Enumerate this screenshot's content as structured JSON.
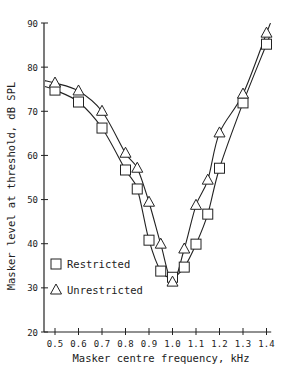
{
  "chart_data": {
    "type": "line",
    "title": "",
    "xlabel": "Masker centre frequency, kHz",
    "ylabel": "Masker level at threshold, dB SPL",
    "xlim": [
      0.45,
      1.42
    ],
    "ylim": [
      20,
      90
    ],
    "x_ticks": [
      0.5,
      0.6,
      0.7,
      0.8,
      0.9,
      1.0,
      1.1,
      1.2,
      1.3,
      1.4
    ],
    "x_tick_labels": [
      "0.5",
      "0.6",
      "0.7",
      "0.8",
      "0.9",
      "1.0",
      "1.1",
      "1.2",
      "1.3",
      "1.4"
    ],
    "y_ticks": [
      20,
      30,
      40,
      50,
      60,
      70,
      80,
      90
    ],
    "y_tick_labels": [
      "20",
      "30",
      "40",
      "50",
      "60",
      "70",
      "80",
      "90"
    ],
    "grid": false,
    "legend_position": "lower-left",
    "series": [
      {
        "name": "Restricted",
        "marker": "square",
        "x": [
          0.5,
          0.6,
          0.7,
          0.8,
          0.85,
          0.9,
          0.95,
          1.0,
          1.05,
          1.1,
          1.15,
          1.2,
          1.3,
          1.4
        ],
        "values": [
          74.8,
          72.1,
          66.2,
          56.7,
          52.4,
          40.8,
          33.8,
          32.4,
          34.7,
          39.9,
          46.7,
          57.1,
          71.9,
          85.2
        ]
      },
      {
        "name": "Unrestricted",
        "marker": "triangle",
        "x": [
          0.5,
          0.6,
          0.7,
          0.8,
          0.85,
          0.9,
          0.95,
          1.0,
          1.05,
          1.1,
          1.15,
          1.2,
          1.3,
          1.4
        ],
        "values": [
          76.4,
          74.6,
          70.0,
          60.5,
          57.1,
          49.4,
          39.9,
          31.3,
          38.8,
          48.7,
          54.4,
          65.1,
          73.9,
          87.7
        ]
      }
    ]
  },
  "legend": {
    "items": [
      {
        "label": "Restricted",
        "marker": "square"
      },
      {
        "label": "Unrestricted",
        "marker": "triangle"
      }
    ]
  },
  "colors": {
    "ink": "#222222",
    "background": "#ffffff"
  }
}
